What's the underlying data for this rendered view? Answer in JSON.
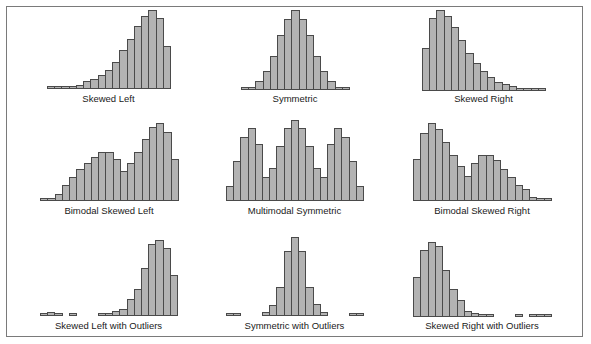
{
  "figure": {
    "colors": {
      "bar_fill": "#b3b3b3",
      "bar_edge": "#4a4a4a",
      "frame": "#7a7a7a"
    }
  },
  "chart_data": [
    {
      "type": "bar",
      "title": "Skewed Left",
      "values": [
        1,
        1.5,
        2,
        3,
        4,
        7,
        9,
        13,
        17,
        25,
        36,
        46,
        57,
        67,
        72,
        65,
        39
      ]
    },
    {
      "type": "bar",
      "title": "Symmetric",
      "values": [
        1,
        2,
        8,
        18,
        32,
        52,
        67,
        75,
        67,
        52,
        32,
        18,
        8,
        3,
        2
      ]
    },
    {
      "type": "bar",
      "title": "Skewed Right",
      "values": [
        37,
        63,
        70,
        65,
        55,
        44,
        33,
        24,
        17,
        12,
        8,
        6,
        4,
        2,
        2,
        1,
        1
      ]
    },
    {
      "type": "bar",
      "title": "Bimodal Skewed Left",
      "values": [
        2,
        3,
        6,
        15,
        22,
        29,
        35,
        40,
        45,
        45,
        38,
        27,
        35,
        45,
        56,
        67,
        71,
        63,
        38
      ]
    },
    {
      "type": "bar",
      "title": "Multimodal Symmetric",
      "values": [
        15,
        39,
        62,
        71,
        56,
        23,
        32,
        54,
        71,
        79,
        71,
        54,
        32,
        23,
        56,
        71,
        62,
        39,
        15
      ]
    },
    {
      "type": "bar",
      "title": "Bimodal Skewed Right",
      "values": [
        38,
        62,
        71,
        66,
        54,
        42,
        32,
        23,
        35,
        42,
        42,
        37,
        29,
        22,
        15,
        11,
        4,
        2,
        1
      ]
    },
    {
      "type": "bar",
      "title": "Skewed Left with Outliers",
      "values": [
        2,
        4,
        2,
        0,
        2,
        0,
        0,
        0,
        1,
        3,
        5,
        7,
        16,
        25,
        45,
        67,
        71,
        64,
        38
      ]
    },
    {
      "type": "bar",
      "title": "Symmetric with Outliers",
      "values": [
        3,
        2,
        0,
        0,
        0,
        4,
        11,
        29,
        64,
        78,
        64,
        29,
        12,
        4,
        0,
        0,
        0,
        2,
        3
      ]
    },
    {
      "type": "bar",
      "title": "Skewed Right with Outliers",
      "values": [
        37,
        63,
        70,
        66,
        44,
        26,
        16,
        6,
        4,
        2,
        1,
        0,
        0,
        0,
        1,
        0,
        1,
        3,
        1
      ]
    }
  ],
  "panels": [
    {
      "label": "Skewed Left"
    },
    {
      "label": "Symmetric"
    },
    {
      "label": "Skewed Right"
    },
    {
      "label": "Bimodal Skewed Left"
    },
    {
      "label": "Multimodal Symmetric"
    },
    {
      "label": "Bimodal Skewed Right"
    },
    {
      "label": "Skewed Left with Outliers"
    },
    {
      "label": "Symmetric with Outliers"
    },
    {
      "label": "Skewed Right with Outliers"
    }
  ]
}
